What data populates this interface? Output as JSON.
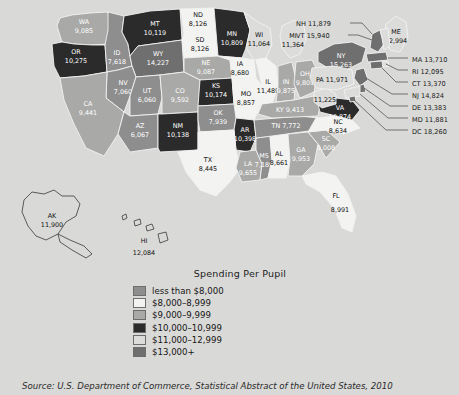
{
  "map": {
    "title": "Spending Per Pupil",
    "source": "Source: U.S. Department of Commerce, Statistical Abstract of the United States, 2010",
    "background_color": "#d9d9d7",
    "states": [
      {
        "code": "WA",
        "value": "9,085",
        "bucket": 3
      },
      {
        "code": "OR",
        "value": "10,275",
        "bucket": 4
      },
      {
        "code": "ID",
        "value": "7,618",
        "bucket": 1
      },
      {
        "code": "MT",
        "value": "10,119",
        "bucket": 4
      },
      {
        "code": "WY",
        "value": "14,227",
        "bucket": 6
      },
      {
        "code": "ND",
        "value": "8,991",
        "bucket": 2
      },
      {
        "code": "SD",
        "value": "8,126",
        "bucket": 2
      },
      {
        "code": "NE",
        "value": "9,087",
        "bucket": 3
      },
      {
        "code": "MN",
        "value": "10,809",
        "bucket": 4
      },
      {
        "code": "IA",
        "value": "8,680",
        "bucket": 2
      },
      {
        "code": "WI",
        "value": "11,064",
        "bucket": 5
      },
      {
        "code": "MI",
        "value": "11,364",
        "bucket": 5
      },
      {
        "code": "NV",
        "value": "7,060",
        "bucket": 1
      },
      {
        "code": "UT",
        "value": "6,060",
        "bucket": 1
      },
      {
        "code": "CA",
        "value": "9,441",
        "bucket": 3
      },
      {
        "code": "CO",
        "value": "9,592",
        "bucket": 3
      },
      {
        "code": "KS",
        "value": "10,174",
        "bucket": 4
      },
      {
        "code": "MO",
        "value": "8,857",
        "bucket": 2
      },
      {
        "code": "IL",
        "value": "11,489",
        "bucket": 5
      },
      {
        "code": "IN",
        "value": "9,875",
        "bucket": 3
      },
      {
        "code": "OH",
        "value": "9,809",
        "bucket": 3
      },
      {
        "code": "AZ",
        "value": "6,067",
        "bucket": 1
      },
      {
        "code": "NM",
        "value": "10,138",
        "bucket": 4
      },
      {
        "code": "OK",
        "value": "7,939",
        "bucket": 1
      },
      {
        "code": "AR",
        "value": "10,398",
        "bucket": 4
      },
      {
        "code": "TX",
        "value": "8,445",
        "bucket": 2
      },
      {
        "code": "LA",
        "value": "9,655",
        "bucket": 3
      },
      {
        "code": "MS",
        "value": "7,189",
        "bucket": 1
      },
      {
        "code": "AL",
        "value": "8,661",
        "bucket": 2
      },
      {
        "code": "TN",
        "value": "7,772",
        "bucket": 1
      },
      {
        "code": "KY",
        "value": "9,413",
        "bucket": 3
      },
      {
        "code": "GA",
        "value": "9,953",
        "bucket": 3
      },
      {
        "code": "FL",
        "value": "8,991",
        "bucket": 2
      },
      {
        "code": "SC",
        "value": "9,008",
        "bucket": 3
      },
      {
        "code": "NC",
        "value": "8,634",
        "bucket": 2
      },
      {
        "code": "VA",
        "value": "10,874",
        "bucket": 4
      },
      {
        "code": "WV",
        "value": "11,225",
        "bucket": 5
      },
      {
        "code": "NY",
        "value": "15,263",
        "bucket": 6
      },
      {
        "code": "PA",
        "value": "11,971",
        "bucket": 5
      },
      {
        "code": "AK",
        "value": "11,900",
        "bucket": 5
      },
      {
        "code": "HI",
        "value": "12,084",
        "bucket": 5
      }
    ],
    "callouts": [
      {
        "code": "NH",
        "label": "NH 11,879"
      },
      {
        "code": "VT",
        "label": "VT 15,940"
      },
      {
        "code": "ME",
        "label": "ME",
        "value": "12,994"
      },
      {
        "code": "MA",
        "label": "MA 13,710"
      },
      {
        "code": "RI",
        "label": "RI 12,095"
      },
      {
        "code": "CT",
        "label": "CT 13,370"
      },
      {
        "code": "NJ",
        "label": "NJ 14,824"
      },
      {
        "code": "DE",
        "label": "DE 13,383"
      },
      {
        "code": "MD",
        "label": "MD 11,881"
      },
      {
        "code": "DC",
        "label": "DC 18,260"
      }
    ],
    "legend": [
      {
        "label": "less than $8,000",
        "color": "#8e8e8e"
      },
      {
        "label": "$8,000–8,999",
        "color": "#f3f3f1"
      },
      {
        "label": "$9,000–9,999",
        "color": "#a9a9a7"
      },
      {
        "label": "$10,000–10,999",
        "color": "#2b2b2b"
      },
      {
        "label": "$11,000–12,999",
        "color": "#dcdcda"
      },
      {
        "label": "$13,000+",
        "color": "#6f6f6f"
      }
    ]
  }
}
